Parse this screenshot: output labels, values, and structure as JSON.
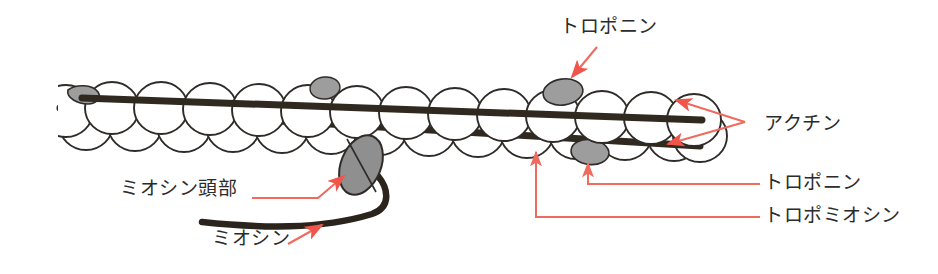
{
  "figure": {
    "background_color": "#ffffff",
    "colors": {
      "actin_outline": "#2f2b28",
      "actin_fill": "#ffffff",
      "tropomyosin_strand": "#30291f",
      "troponin_fill": "#9d9d9d",
      "myosin_head_fill": "#8f8f8f",
      "myosin_tail": "#2b241c",
      "leader_line": "#ee6b5e",
      "label_text": "#2b2b2b"
    }
  },
  "labels": {
    "troponin_top": "トロポニン",
    "actin": "アクチン",
    "troponin_right": "トロポニン",
    "tropomyosin": "トロポミオシン",
    "myosin_head": "ミオシン頭部",
    "myosin": "ミオシン"
  },
  "structures": {
    "actin_monomers_upper_count": 14,
    "actin_monomers_lower_count": 14,
    "tropomyosin_strands": 2,
    "troponin_blobs": 4,
    "myosin_heads": 1
  },
  "annotations": [
    {
      "name": "troponin-top",
      "target": "troponin blob on upper tropomyosin strand",
      "arrow": "diagonal down-left"
    },
    {
      "name": "actin",
      "target": "actin monomer spheres at right end",
      "arrow": "two arrows to one vertex"
    },
    {
      "name": "troponin-right",
      "target": "troponin blob on lower strand",
      "arrow": "elbow leader, upward"
    },
    {
      "name": "tropomyosin",
      "target": "lower tropomyosin strand",
      "arrow": "elbow leader, upward"
    },
    {
      "name": "myosin-head",
      "target": "gray myosin head ellipse",
      "arrow": "elbow leader, up-right"
    },
    {
      "name": "myosin",
      "target": "myosin tail rod",
      "arrow": "diagonal up-right"
    }
  ]
}
